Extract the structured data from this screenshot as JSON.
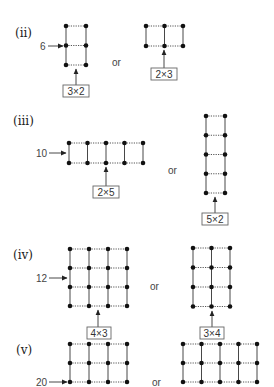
{
  "sections": [
    {
      "label": "(ii)",
      "total": "6",
      "or": "or",
      "arrays": [
        {
          "rows": 3,
          "cols": 2,
          "caption": "3×2"
        },
        {
          "rows": 2,
          "cols": 3,
          "caption": "2×3"
        }
      ]
    },
    {
      "label": "(iii)",
      "total": "10",
      "or": "or",
      "arrays": [
        {
          "rows": 2,
          "cols": 5,
          "caption": "2×5"
        },
        {
          "rows": 5,
          "cols": 2,
          "caption": "5×2"
        }
      ]
    },
    {
      "label": "(iv)",
      "total": "12",
      "or": "or",
      "arrays": [
        {
          "rows": 4,
          "cols": 4,
          "caption": "4×3"
        },
        {
          "rows": 4,
          "cols": 3,
          "caption": "3×4"
        }
      ]
    },
    {
      "label": "(v)",
      "total": "20",
      "or": "or",
      "arrays": [
        {
          "rows": 3,
          "cols": 4
        },
        {
          "rows": 3,
          "cols": 5
        }
      ]
    }
  ]
}
